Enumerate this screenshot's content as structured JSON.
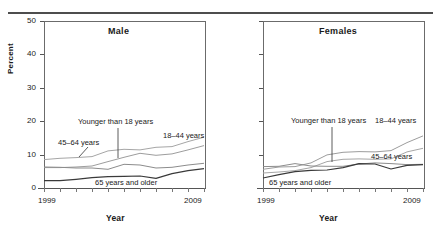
{
  "chart_data": {
    "type": "line",
    "title": "",
    "xlabel": "Year",
    "ylabel": "Percent",
    "xlim": [
      1999,
      2009
    ],
    "ylim": [
      0,
      50
    ],
    "ytick_labels": [
      "0",
      "10",
      "20",
      "30",
      "40",
      "50"
    ],
    "ytick_values": [
      0,
      10,
      20,
      30,
      40,
      50
    ],
    "xtick_labels": [
      "1999",
      "2009"
    ],
    "x": [
      1999,
      2000,
      2001,
      2002,
      2003,
      2004,
      2005,
      2006,
      2007,
      2008,
      2009
    ],
    "grid": false,
    "legend_position": "inline-annotations",
    "panels": [
      {
        "name": "male-panel",
        "title": "Male",
        "xlabel": "Year",
        "ylabel": "Percent",
        "series": [
          {
            "name": "Younger than 18 years",
            "color": "#9d9d9d",
            "values": [
              6.1,
              6.1,
              6.3,
              6.6,
              7.9,
              9.2,
              10.4,
              9.8,
              10.2,
              11.4,
              12.7
            ]
          },
          {
            "name": "18–44 years",
            "color": "#8c8c8c",
            "values": [
              6.3,
              6.2,
              6.0,
              6.0,
              5.6,
              7.1,
              6.9,
              6.0,
              6.2,
              6.9,
              7.4
            ]
          },
          {
            "name": "45–64 years",
            "color": "#a6a6a6",
            "values": [
              8.5,
              8.9,
              9.1,
              9.4,
              11.1,
              11.6,
              11.4,
              12.2,
              12.4,
              13.9,
              15.2
            ]
          },
          {
            "name": "65 years and older",
            "color": "#3a3a3a",
            "values": [
              2.2,
              2.2,
              2.6,
              3.1,
              3.4,
              3.5,
              3.6,
              2.9,
              4.3,
              5.2,
              5.8
            ]
          }
        ],
        "annotations": [
          {
            "text": "Younger than 18 years",
            "target": "younger-than-18-label"
          },
          {
            "text": "18–44 years",
            "target": "18-44-label"
          },
          {
            "text": "45–64 years",
            "target": "45-64-label"
          },
          {
            "text": "65 years and older",
            "target": "65-and-older-label"
          }
        ]
      },
      {
        "name": "females-panel",
        "title": "Females",
        "xlabel": "Year",
        "ylabel": "Percent",
        "series": [
          {
            "name": "Younger than 18 years",
            "color": "#9d9d9d",
            "values": [
              5.6,
              6.3,
              6.4,
              7.5,
              9.9,
              10.7,
              10.9,
              10.8,
              11.2,
              13.6,
              15.6
            ]
          },
          {
            "name": "18–44 years",
            "color": "#a6a6a6",
            "values": [
              4.5,
              4.8,
              5.2,
              6.1,
              7.9,
              8.6,
              8.7,
              8.6,
              8.7,
              10.8,
              11.9
            ]
          },
          {
            "name": "45–64 years",
            "color": "#8c8c8c",
            "values": [
              6.4,
              6.5,
              7.3,
              6.6,
              6.5,
              6.5,
              7.2,
              7.5,
              7.3,
              7.0,
              7.1
            ]
          },
          {
            "name": "65 years and older",
            "color": "#3a3a3a",
            "values": [
              3.0,
              4.0,
              4.9,
              5.3,
              5.4,
              6.1,
              7.3,
              7.2,
              5.7,
              6.8,
              7.0
            ]
          }
        ],
        "annotations": [
          {
            "text": "Younger than 18 years",
            "target": "younger-than-18-label"
          },
          {
            "text": "18–44 years",
            "target": "18-44-label"
          },
          {
            "text": "45–64 years",
            "target": "45-64-label"
          },
          {
            "text": "65 years and older",
            "target": "65-and-older-label"
          }
        ]
      }
    ]
  },
  "male": {
    "title": "Male",
    "ylabel": "Percent",
    "xlabel": "Year",
    "x_start": "1999",
    "x_end": "2009",
    "yticks": [
      "50",
      "40",
      "30",
      "20",
      "10",
      "0"
    ],
    "labels": {
      "younger": "Younger than 18 years",
      "y1844": "18–44 years",
      "y4564": "45–64 years",
      "y65": "65 years and older"
    }
  },
  "female": {
    "title": "Females",
    "xlabel": "Year",
    "x_start": "1999",
    "x_end": "2009",
    "labels": {
      "younger": "Younger than 18 years",
      "y1844": "18–44 years",
      "y4564": "45–64 years",
      "y65": "65 years and older"
    }
  }
}
